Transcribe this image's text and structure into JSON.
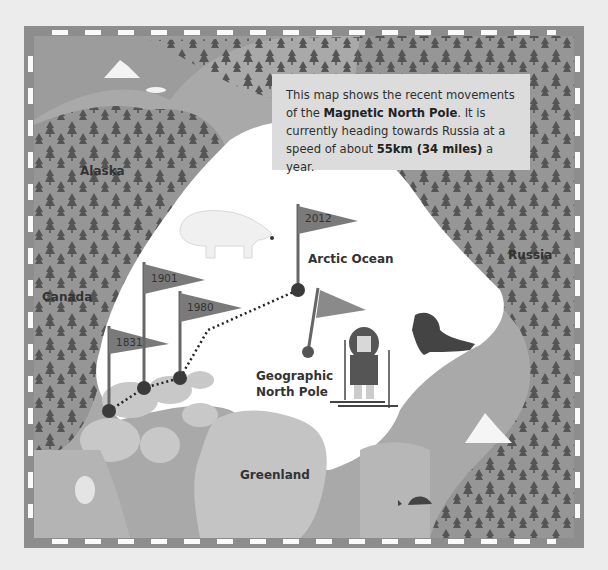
{
  "info_box": {
    "line1": "This map shows the recent movements",
    "line2_pre": "of the ",
    "line2_bold": "Magnetic North Pole",
    "line2_post": ". It is",
    "line3": "currently heading towards Russia at a",
    "line4_pre": "speed of about ",
    "line4_bold": "55km (34 miles)",
    "line4_post": " a year."
  },
  "regions": {
    "alaska": "Alaska",
    "canada": "Canada",
    "russia": "Russia",
    "greenland": "Greenland",
    "arctic_ocean": "Arctic Ocean",
    "geographic_north_pole_line1": "Geographic",
    "geographic_north_pole_line2": "North Pole"
  },
  "magnetic_pole_flags": [
    {
      "year": "1831"
    },
    {
      "year": "1901"
    },
    {
      "year": "1980"
    },
    {
      "year": "2012"
    }
  ],
  "illustrations": [
    "polar-bear",
    "walrus",
    "explorer-on-skis",
    "whale",
    "iceberg",
    "pine-trees"
  ],
  "colors": {
    "frame": "#8d8d8d",
    "land": "#a9a9a9",
    "ice": "#ffffff",
    "trees": "#555555",
    "flag": "#7a7a7a",
    "pole_marker": "#3a3a3a"
  }
}
